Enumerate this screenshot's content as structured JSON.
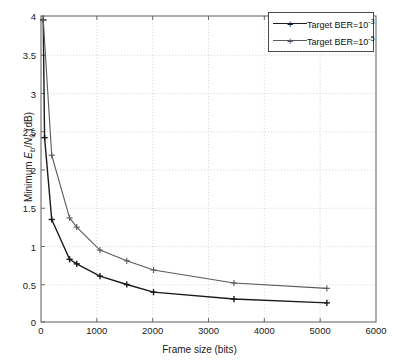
{
  "figure": {
    "background": "#ffffff",
    "plot_frame_color": "#6b6b6b",
    "grid_color": "#c9c9c9"
  },
  "axes": {
    "xlabel": "Frame size (bits)",
    "ylabel_plain": "Minimum Eb/N0 (dB)",
    "ylabel_prefix": "Minimum ",
    "ylabel_E": "E",
    "ylabel_b": "b",
    "ylabel_slash": "/",
    "ylabel_N": "N",
    "ylabel_0": "0",
    "ylabel_suffix": " (dB)",
    "xticks": [
      "0",
      "1000",
      "2000",
      "3000",
      "4000",
      "5000",
      "6000"
    ],
    "xtick_values": [
      0,
      1000,
      2000,
      3000,
      4000,
      5000,
      6000
    ],
    "yticks": [
      "0",
      "0.5",
      "1",
      "1.5",
      "2",
      "2.5",
      "3",
      "3.5",
      "4"
    ],
    "ytick_values": [
      0,
      0.5,
      1,
      1.5,
      2,
      2.5,
      3,
      3.5,
      4
    ],
    "xlim": [
      0,
      6000
    ],
    "ylim": [
      0,
      4
    ]
  },
  "legend": {
    "position": "top-right",
    "border_color": "#4a4a4a",
    "entries": [
      {
        "label_prefix": "Target BER=10",
        "label_exp": "-3",
        "marker": "+",
        "color": "#1a1a1a"
      },
      {
        "label_prefix": "Target BER=10",
        "label_exp": "-5",
        "marker": "+",
        "color": "#5a5a5a"
      }
    ]
  },
  "chart_data": {
    "type": "line",
    "title": "",
    "xlabel": "Frame size (bits)",
    "ylabel": "Minimum Eb/N0 (dB)",
    "xlim": [
      0,
      6000
    ],
    "ylim": [
      0,
      4
    ],
    "grid": true,
    "grid_style": "dotted",
    "legend_position": "upper right",
    "series": [
      {
        "name": "Target BER=10^-3",
        "color": "#1a1a1a",
        "marker": "+",
        "linewidth": 1.4,
        "x": [
          40,
          64,
          192,
          512,
          640,
          1056,
          1536,
          2016,
          3456,
          5120
        ],
        "y": [
          3.95,
          2.41,
          1.34,
          0.82,
          0.76,
          0.6,
          0.49,
          0.39,
          0.3,
          0.25
        ]
      },
      {
        "name": "Target BER=10^-5",
        "color": "#5a5a5a",
        "marker": "+",
        "linewidth": 1.1,
        "x": [
          40,
          192,
          512,
          640,
          1056,
          1536,
          2016,
          3456,
          5120
        ],
        "y": [
          3.95,
          2.18,
          1.36,
          1.24,
          0.94,
          0.8,
          0.68,
          0.51,
          0.44
        ]
      }
    ]
  }
}
